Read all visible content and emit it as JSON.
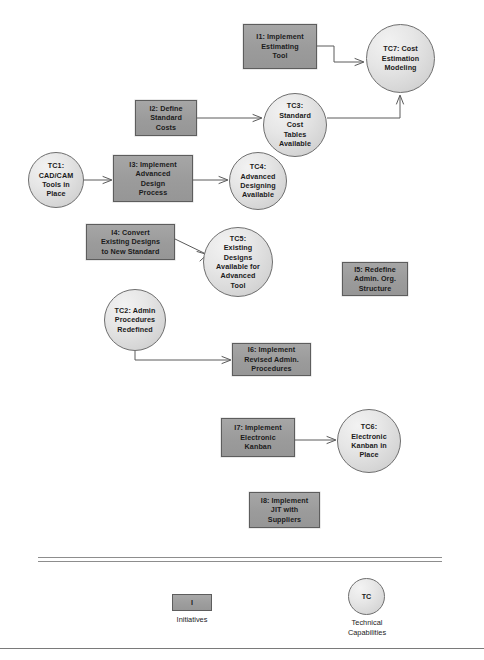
{
  "diagram": {
    "colors": {
      "initiative_fill": "#9b9b9b",
      "initiative_border": "#5d5d5d",
      "capability_fill": "#e0e0e0",
      "capability_border": "#6e6e6e",
      "connector": "#555555",
      "background": "#ffffff"
    },
    "nodes": [
      {
        "id": "I1",
        "type": "initiative",
        "label": "I1: Implement\nEstimating\nTool",
        "x": 243,
        "y": 24,
        "w": 74,
        "h": 45
      },
      {
        "id": "TC7",
        "type": "capability",
        "label": "TC7: Cost\nEstimation\nModeling",
        "x": 366,
        "y": 24,
        "w": 69,
        "h": 69
      },
      {
        "id": "I2",
        "type": "initiative",
        "label": "I2: Define\nStandard\nCosts",
        "x": 135,
        "y": 100,
        "w": 62,
        "h": 36
      },
      {
        "id": "TC3",
        "type": "capability",
        "label": "TC3:\nStandard\nCost\nTables\nAvailable",
        "x": 263,
        "y": 93,
        "w": 64,
        "h": 64
      },
      {
        "id": "TC1",
        "type": "capability",
        "label": "TC1:\nCAD/CAM\nTools in\nPlace",
        "x": 28,
        "y": 152,
        "w": 56,
        "h": 56
      },
      {
        "id": "I3",
        "type": "initiative",
        "label": "I3: Implement\nAdvanced\nDesign\nProcess",
        "x": 113,
        "y": 155,
        "w": 80,
        "h": 47
      },
      {
        "id": "TC4",
        "type": "capability",
        "label": "TC4:\nAdvanced\nDesigning\nAvailable",
        "x": 229,
        "y": 152,
        "w": 58,
        "h": 58
      },
      {
        "id": "I4",
        "type": "initiative",
        "label": "I4: Convert\nExisting Designs\nto New Standard",
        "x": 86,
        "y": 224,
        "w": 89,
        "h": 36
      },
      {
        "id": "TC5",
        "type": "capability",
        "label": "TC5:\nExisting\nDesigns\nAvailable for\nAdvanced\nTool",
        "x": 203,
        "y": 227,
        "w": 70,
        "h": 70
      },
      {
        "id": "I5",
        "type": "initiative",
        "label": "I5: Redefine\nAdmin. Org.\nStructure",
        "x": 342,
        "y": 262,
        "w": 66,
        "h": 34
      },
      {
        "id": "TC2",
        "type": "capability",
        "label": "TC2: Admin\nProcedures\nRedefined",
        "x": 104,
        "y": 289,
        "w": 62,
        "h": 62
      },
      {
        "id": "I6",
        "type": "initiative",
        "label": "I6: Implement\nRevised Admin.\nProcedures",
        "x": 232,
        "y": 343,
        "w": 79,
        "h": 33
      },
      {
        "id": "I7",
        "type": "initiative",
        "label": "I7: Implement\nElectronic\nKanban",
        "x": 221,
        "y": 418,
        "w": 74,
        "h": 39
      },
      {
        "id": "TC6",
        "type": "capability",
        "label": "TC6:\nElectronic\nKanban in\nPlace",
        "x": 337,
        "y": 409,
        "w": 64,
        "h": 64
      },
      {
        "id": "I8",
        "type": "initiative",
        "label": "I8: Implement\nJIT with\nSuppliers",
        "x": 249,
        "y": 492,
        "w": 71,
        "h": 36
      }
    ],
    "connections": [
      {
        "from": "I1",
        "to": "TC7",
        "description": "I1 Implement Estimating Tool enables TC7 Cost Estimation Modeling"
      },
      {
        "from": "TC3",
        "to": "TC7",
        "description": "TC3 Standard Cost Tables Available enables TC7 Cost Estimation Modeling"
      },
      {
        "from": "I2",
        "to": "TC3",
        "description": "I2 Define Standard Costs enables TC3 Standard Cost Tables Available"
      },
      {
        "from": "TC1",
        "to": "I3",
        "description": "TC1 CAD/CAM Tools in Place enables I3 Implement Advanced Design Process"
      },
      {
        "from": "I3",
        "to": "TC4",
        "description": "I3 Implement Advanced Design Process enables TC4 Advanced Designing Available"
      },
      {
        "from": "I4",
        "to": "TC5",
        "description": "I4 Convert Existing Designs to New Standard enables TC5 Existing Designs Available for Advanced Tool"
      },
      {
        "from": "TC2",
        "to": "I6",
        "description": "TC2 Admin Procedures Redefined enables I6 Implement Revised Admin. Procedures"
      },
      {
        "from": "I7",
        "to": "TC6",
        "description": "I7 Implement Electronic Kanban enables TC6 Electronic Kanban in Place"
      }
    ]
  },
  "legend": {
    "initiative": {
      "symbol": "I",
      "caption": "Initiatives"
    },
    "capability": {
      "symbol": "TC",
      "caption": "Technical\nCapabilities"
    }
  }
}
